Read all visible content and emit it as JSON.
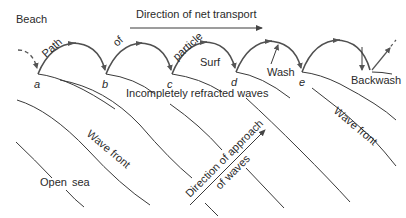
{
  "labels": {
    "beach": "Beach",
    "net_transport": "Direction of net transport",
    "path": "Path",
    "of": "of",
    "particle": "particle",
    "surf": "Surf",
    "wash": "Wash",
    "backwash": "Backwash",
    "incompletely_refracted": "Incompletely refracted waves",
    "wave_front_left": "Wave front",
    "wave_front_right": "Wave front",
    "open_sea_1": "Open",
    "open_sea_2": "sea",
    "approach_1": "Direction of approach",
    "approach_2": "of waves"
  },
  "points": [
    "a",
    "b",
    "c",
    "d",
    "e"
  ],
  "colors": {
    "line": "#3a3a3a",
    "arc": "#505050",
    "text": "#2a2a2a",
    "background": "#ffffff"
  }
}
